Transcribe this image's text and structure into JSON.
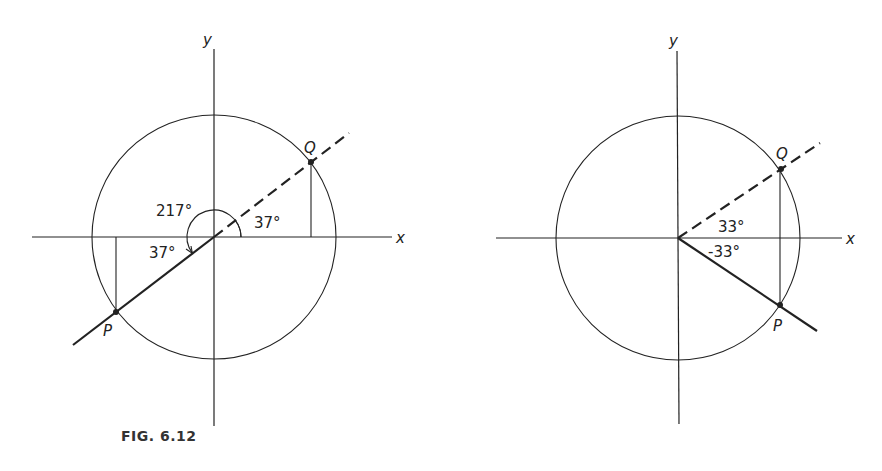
{
  "caption": "FIG. 6.12",
  "left_figure": {
    "axis_x_label": "x",
    "axis_y_label": "y",
    "point_q_label": "Q",
    "point_p_label": "P",
    "angle_reference_label": "37°",
    "angle_full_label": "217°",
    "angle_p_label": "37°"
  },
  "right_figure": {
    "axis_x_label": "x",
    "axis_y_label": "y",
    "point_q_label": "Q",
    "point_p_label": "P",
    "angle_positive_label": "33°",
    "angle_negative_label": "-33°"
  },
  "colors": {
    "ink": "#222222",
    "background": "#ffffff"
  }
}
